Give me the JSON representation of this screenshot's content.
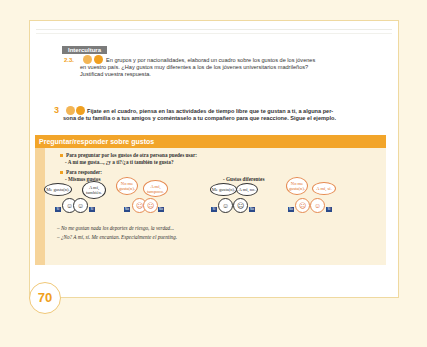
{
  "page": {
    "number": "70"
  },
  "section_tag": "Intercultura",
  "exercises": [
    {
      "number": "2.3.",
      "text_line1": "En grupos y por nacionalidades, elaborad un cuadro sobre los gustos de los jóvenes",
      "text_line2": "en vuestro país. ¿Hay gustos muy diferentes a los de los jóvenes universitarios madrileños?",
      "text_line3": "Justificad vuestra respuesta."
    },
    {
      "number": "3",
      "text_line1": "Fíjate en el cuadro, piensa en las actividades de tiempo libre que te gustan a ti, a alguna per-",
      "text_line2": "sona de tu familia o a tus amigos y coméntaselo a tu compañero para que reaccione. Sigue el ejemplo."
    }
  ],
  "box": {
    "title": "Preguntar/responder sobre gustos",
    "ask_intro": "Para preguntar por los gustos de otra persona puedes usar:",
    "ask_example_a": "- A mí me gusta..., ¿y a ti?/",
    "ask_example_b": "¿a ti también te gusta?",
    "answer_intro": "Para responder:",
    "same_label": "- Mismos gustos",
    "diff_label": "- Gustos diferentes",
    "bubbles": [
      "Me gusta(n).",
      "A mí, también.",
      "No me gusta(n).",
      "A mí, tampoco.",
      "Me gusta(n).",
      "A mí, no.",
      "No me gusta(n).",
      "A mí, sí."
    ],
    "badges": [
      "Sí",
      "Sí",
      "No",
      "No",
      "Sí",
      "No",
      "No",
      "Sí"
    ],
    "example_line1": "– No me gustan nada los deportes de riesgo, la verdad...",
    "example_line2": "– ¿No? A mí, sí. Me encantan. Especialmente el puenting."
  },
  "colors": {
    "accent": "#f2a52a",
    "box_bg": "#fbf2dc",
    "badge": "#2a4a8a"
  }
}
